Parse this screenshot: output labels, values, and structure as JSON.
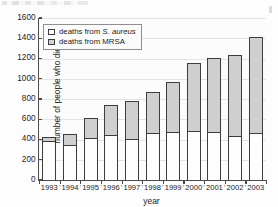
{
  "chart_data": {
    "type": "bar",
    "subtype": "stacked-vertical",
    "title": "",
    "xlabel": "year",
    "ylabel": "number of people who died",
    "categories": [
      "1993",
      "1994",
      "1995",
      "1996",
      "1997",
      "1998",
      "1999",
      "2000",
      "2001",
      "2002",
      "2003"
    ],
    "series": [
      {
        "name": "deaths from S. aureus",
        "legend_label_plain": "deaths from S. aureus",
        "legend_label_prefix": "deaths from ",
        "legend_label_italic": "S. aureus",
        "color": "#ffffff",
        "values": [
          385,
          350,
          415,
          445,
          405,
          460,
          475,
          485,
          475,
          435,
          460
        ]
      },
      {
        "name": "deaths from MRSA",
        "legend_label_plain": "deaths from MRSA",
        "legend_label_prefix": "deaths from ",
        "legend_label_italic": "",
        "color": "#cfcfcf",
        "values": [
          40,
          100,
          195,
          300,
          380,
          410,
          495,
          670,
          735,
          795,
          950
        ]
      }
    ],
    "totals": [
      425,
      450,
      610,
      745,
      785,
      870,
      970,
      1155,
      1210,
      1230,
      1410
    ],
    "yticks": [
      0,
      200,
      400,
      600,
      800,
      1000,
      1200,
      1400,
      1600
    ],
    "ylim": [
      0,
      1600
    ],
    "grid": true,
    "legend_position": "top-left"
  },
  "axes": {
    "x_title": "year",
    "y_title": "number of people who died"
  }
}
